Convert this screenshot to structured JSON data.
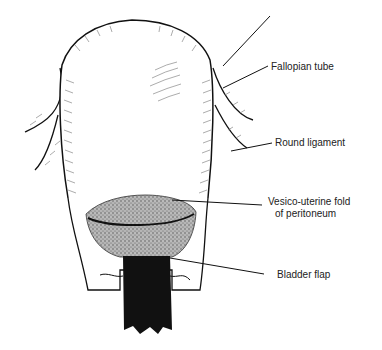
{
  "figure": {
    "labels": [
      {
        "id": "fallopian-tube",
        "text": "Fallopian tube"
      },
      {
        "id": "round-ligament",
        "text": "Round ligament"
      },
      {
        "id": "vesico-uterine-fold-line1",
        "text": "Vesico-uterine fold"
      },
      {
        "id": "vesico-uterine-fold-line2",
        "text": "of peritoneum"
      },
      {
        "id": "bladder-flap",
        "text": "Bladder flap"
      }
    ]
  },
  "colors": {
    "ink": "#111111",
    "hatch": "#777777",
    "stipple": "#8a8a8a",
    "background": "#ffffff"
  }
}
